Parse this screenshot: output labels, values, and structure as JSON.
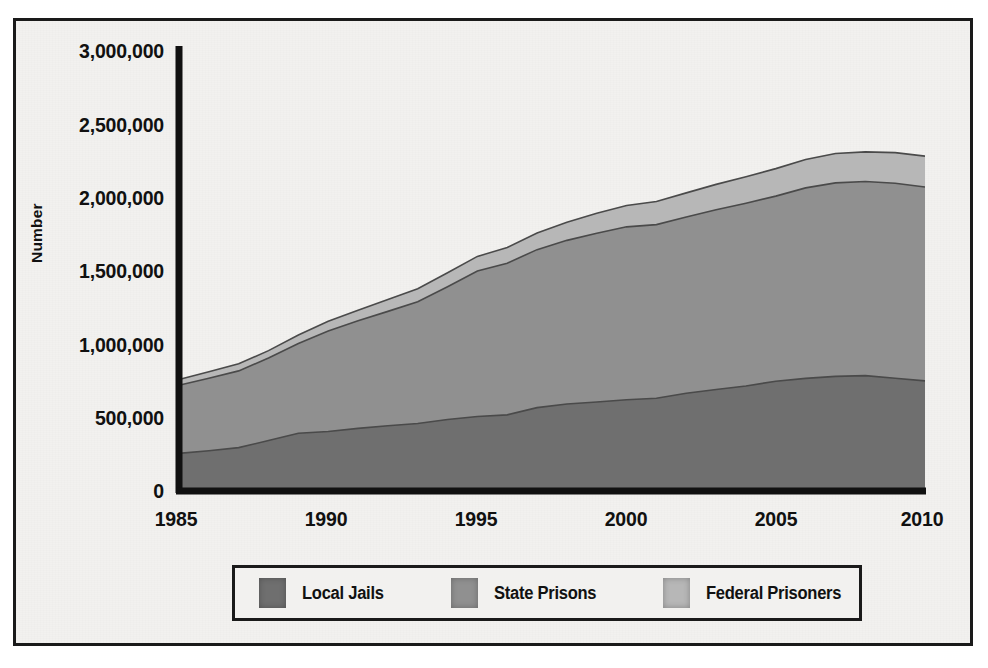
{
  "figure": {
    "background_color": "#f2f1ef",
    "frame_color": "#1a1a1a"
  },
  "axis": {
    "ylabel": "Number",
    "yticks": [
      "0",
      "500,000",
      "1,000,000",
      "1,500,000",
      "2,000,000",
      "2,500,000",
      "3,000,000"
    ],
    "xticks": [
      "1985",
      "1990",
      "1995",
      "2000",
      "2005",
      "2010"
    ]
  },
  "legend": {
    "items": [
      {
        "label": "Local Jails",
        "color": "#6f6f6f"
      },
      {
        "label": "State Prisons",
        "color": "#909090"
      },
      {
        "label": "Federal Prisoners",
        "color": "#b7b7b7"
      }
    ]
  },
  "chart_data": {
    "type": "area",
    "stacked": true,
    "title": "",
    "xlabel": "",
    "ylabel": "Number",
    "xlim": [
      1985,
      2010
    ],
    "ylim": [
      0,
      3000000
    ],
    "ytick_values": [
      0,
      500000,
      1000000,
      1500000,
      2000000,
      2500000,
      3000000
    ],
    "xtick_values": [
      1985,
      1990,
      1995,
      2000,
      2005,
      2010
    ],
    "grid": false,
    "legend_position": "bottom",
    "x": [
      1985,
      1986,
      1987,
      1988,
      1989,
      1990,
      1991,
      1992,
      1993,
      1994,
      1995,
      1996,
      1997,
      1998,
      1999,
      2000,
      2001,
      2002,
      2003,
      2004,
      2005,
      2006,
      2007,
      2008,
      2009,
      2010
    ],
    "series": [
      {
        "name": "Local Jails",
        "color": "#6f6f6f",
        "values": [
          256000,
          274000,
          295000,
          343000,
          393000,
          405000,
          426000,
          444000,
          459000,
          486000,
          507000,
          518000,
          567000,
          592000,
          605000,
          621000,
          631000,
          665000,
          691000,
          714000,
          747000,
          766000,
          780000,
          785000,
          767000,
          749000
        ]
      },
      {
        "name": "State Prisons",
        "color": "#909090",
        "values": [
          463000,
          493000,
          522000,
          562000,
          610000,
          684000,
          732000,
          778000,
          828000,
          904000,
          989000,
          1032000,
          1075000,
          1113000,
          1149000,
          1176000,
          1181000,
          1199000,
          1222000,
          1244000,
          1259000,
          1296000,
          1316000,
          1320000,
          1327000,
          1319000
        ]
      },
      {
        "name": "Federal Prisoners",
        "color": "#b7b7b7",
        "values": [
          40000,
          44000,
          48000,
          50000,
          58000,
          65000,
          71000,
          80000,
          89000,
          95000,
          100000,
          106000,
          113000,
          123000,
          135000,
          145000,
          157000,
          164000,
          173000,
          180000,
          187000,
          193000,
          200000,
          202000,
          208000,
          210000
        ]
      }
    ],
    "totals": [
      759000,
      811000,
      865000,
      955000,
      1061000,
      1154000,
      1229000,
      1302000,
      1376000,
      1485000,
      1596000,
      1656000,
      1755000,
      1828000,
      1889000,
      1942000,
      1969000,
      2028000,
      2086000,
      2138000,
      2193000,
      2255000,
      2296000,
      2307000,
      2302000,
      2278000
    ]
  }
}
